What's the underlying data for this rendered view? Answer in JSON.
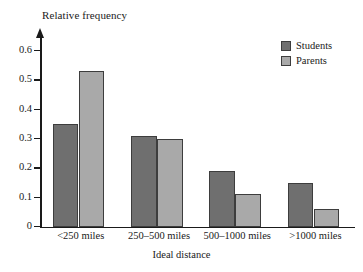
{
  "chart_data": {
    "type": "bar",
    "title": "",
    "xlabel": "Ideal distance",
    "ylabel": "Relative frequency",
    "categories": [
      "<250 miles",
      "250–500 miles",
      "500–1000 miles",
      ">1000 miles"
    ],
    "series": [
      {
        "name": "Students",
        "color": "#6f6f6f",
        "values": [
          0.35,
          0.31,
          0.19,
          0.15
        ]
      },
      {
        "name": "Parents",
        "color": "#a9a9a9",
        "values": [
          0.53,
          0.3,
          0.11,
          0.06
        ]
      }
    ],
    "ylim": [
      0,
      0.65
    ],
    "ytick_labels": [
      "0",
      "0.1",
      "0.2",
      "0.3",
      "0.4",
      "0.5",
      "0.6"
    ],
    "ytick_values": [
      0,
      0.1,
      0.2,
      0.3,
      0.4,
      0.5,
      0.6
    ],
    "grid": false,
    "legend_position": "top-right",
    "axis_color": "#1a1a1a"
  },
  "axes": {
    "y_title": "Relative frequency",
    "x_title": "Ideal distance"
  },
  "legend": {
    "entries": [
      {
        "label": "Students"
      },
      {
        "label": "Parents"
      }
    ]
  }
}
